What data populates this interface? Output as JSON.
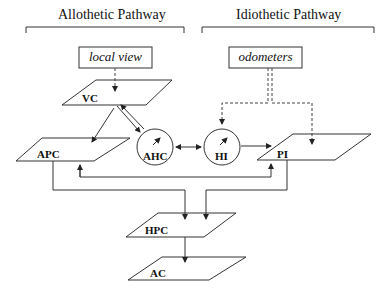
{
  "diagram": {
    "pathways": [
      {
        "id": "allothetic",
        "title": "Allothetic Pathway"
      },
      {
        "id": "idiothetic",
        "title": "Idiothetic Pathway"
      }
    ],
    "inputs": [
      {
        "id": "local_view",
        "label": "local view"
      },
      {
        "id": "odometers",
        "label": "odometers"
      }
    ],
    "layers": [
      {
        "id": "VC",
        "label": "VC",
        "shape": "parallelogram"
      },
      {
        "id": "APC",
        "label": "APC",
        "shape": "parallelogram"
      },
      {
        "id": "PI",
        "label": "PI",
        "shape": "parallelogram"
      },
      {
        "id": "HPC",
        "label": "HPC",
        "shape": "parallelogram"
      },
      {
        "id": "AC",
        "label": "AC",
        "shape": "parallelogram"
      }
    ],
    "circles": [
      {
        "id": "AHC",
        "label": "AHC",
        "shape": "circle-with-needle"
      },
      {
        "id": "HI",
        "label": "HI",
        "shape": "circle-with-needle"
      }
    ],
    "edges": [
      {
        "from": "local_view",
        "to": "VC",
        "style": "dashed"
      },
      {
        "from": "odometers",
        "to": "HI",
        "style": "dashed"
      },
      {
        "from": "odometers",
        "to": "PI",
        "style": "dashed"
      },
      {
        "from": "VC",
        "to": "APC",
        "style": "solid"
      },
      {
        "from": "VC",
        "to": "AHC",
        "style": "solid"
      },
      {
        "from": "AHC",
        "to": "VC",
        "style": "solid"
      },
      {
        "from": "AHC",
        "to": "HI",
        "style": "solid",
        "bidirectional": true
      },
      {
        "from": "HI",
        "to": "PI",
        "style": "solid"
      },
      {
        "from": "APC",
        "to": "PI",
        "style": "solid",
        "bidirectional": true
      },
      {
        "from": "APC",
        "to": "HPC",
        "style": "solid"
      },
      {
        "from": "PI",
        "to": "HPC",
        "style": "solid"
      },
      {
        "from": "HPC",
        "to": "AC",
        "style": "solid"
      }
    ]
  }
}
